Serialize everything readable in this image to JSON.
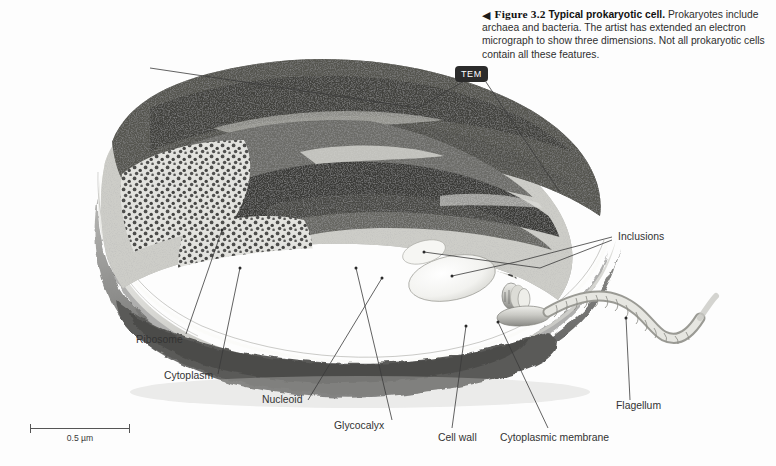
{
  "figure": {
    "arrow_glyph": "◀",
    "number": "Figure 3.2",
    "title": "Typical prokaryotic cell.",
    "body": "Prokaryotes include archaea and bacteria. The artist has extended an electron micrograph to show three dimensions. Not all prokaryotic cells contain all these features."
  },
  "badge": {
    "tem": "TEM"
  },
  "labels": {
    "inclusions": "Inclusions",
    "ribosome": "Ribosome",
    "cytoplasm": "Cytoplasm",
    "nucleoid": "Nucleoid",
    "glycocalyx": "Glycocalyx",
    "cell_wall": "Cell wall",
    "cytoplasmic_membrane": "Cytoplasmic membrane",
    "flagellum": "Flagellum"
  },
  "scale_bar": {
    "value": "0.5 µm"
  },
  "colors": {
    "background": "#fdfdfd",
    "badge_bg": "#2b2b2b",
    "badge_text": "#ffffff",
    "leader_line": "#3a3a3a",
    "text": "#2c2c2c",
    "cell_dark": "#4a4a4a",
    "cell_mid": "#8d8d8d",
    "cell_light": "#d8d8d8",
    "envelope_pale": "#e9e9e6"
  }
}
